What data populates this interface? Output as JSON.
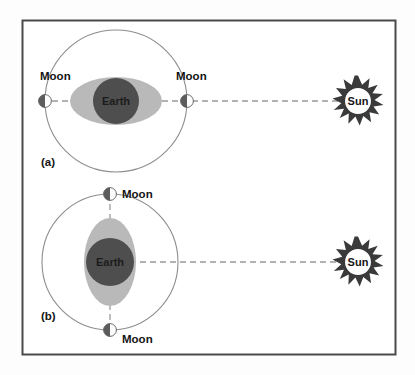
{
  "figure": {
    "background_color": "#fdfdfd",
    "frame_color": "#4a4a4a",
    "orbit_color": "#8d8d8d",
    "bulge_color": "#b9b9b9",
    "earth_color": "#4e4e4e",
    "moon_dark_color": "#5c5c5c",
    "moon_light_color": "#fcfcfc",
    "sun_ray_color": "#3a3a3a",
    "connector_color": "#9a9a9a"
  },
  "panels": [
    {
      "id": "a",
      "label": "(a)",
      "earth_label": "Earth",
      "bulge_orientation": "horizontal",
      "sun_label": "Sun",
      "moons": [
        {
          "label": "Moon",
          "position": "left"
        },
        {
          "label": "Moon",
          "position": "right"
        }
      ]
    },
    {
      "id": "b",
      "label": "(b)",
      "earth_label": "Earth",
      "bulge_orientation": "vertical",
      "sun_label": "Sun",
      "moons": [
        {
          "label": "Moon",
          "position": "top"
        },
        {
          "label": "Moon",
          "position": "bottom"
        }
      ]
    }
  ],
  "labels": {
    "panel_a": "(a)",
    "panel_b": "(b)",
    "earth_a": "Earth",
    "earth_b": "Earth",
    "sun_a": "Sun",
    "sun_b": "Sun",
    "moon_a_left": "Moon",
    "moon_a_right": "Moon",
    "moon_b_top": "Moon",
    "moon_b_bottom": "Moon"
  },
  "icons": {
    "moon": "half-lit-moon-icon",
    "sun": "spiked-sun-icon",
    "earth": "earth-disc-icon",
    "orbit": "orbit-circle-icon",
    "bulge": "tidal-bulge-ellipse-icon",
    "connector": "dashed-alignment-line-icon"
  }
}
